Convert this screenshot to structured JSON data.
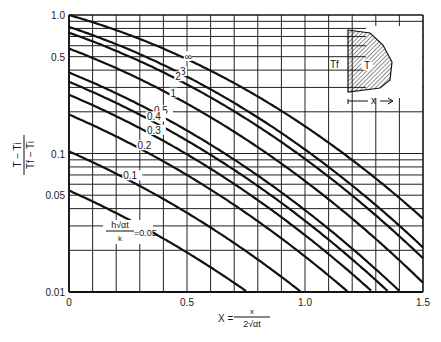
{
  "chart_data": {
    "type": "line",
    "title": "",
    "xlabel": "X = x / (2√(αt))",
    "ylabel": "(T − Ti) / (Tf − Ti)",
    "xscale": "linear",
    "yscale": "log",
    "xlim": [
      0,
      1.5
    ],
    "ylim": [
      0.01,
      1.0
    ],
    "grid": true,
    "x_ticks": [
      {
        "value": 0,
        "label": "0"
      },
      {
        "value": 0.5,
        "label": "0.5"
      },
      {
        "value": 1.0,
        "label": "1.0"
      },
      {
        "value": 1.5,
        "label": "1.5"
      }
    ],
    "y_ticks": [
      {
        "value": 1.0,
        "label": "1.0"
      },
      {
        "value": 0.5,
        "label": "0.5"
      },
      {
        "value": 0.1,
        "label": "0.1"
      },
      {
        "value": 0.05,
        "label": "0.05"
      },
      {
        "value": 0.01,
        "label": "0.01"
      }
    ],
    "legend_title": "h√(αt)/k",
    "x": [
      0,
      0.1,
      0.2,
      0.3,
      0.4,
      0.5,
      0.6,
      0.7,
      0.8,
      0.9,
      1.0,
      1.1,
      1.2,
      1.3,
      1.4,
      1.5
    ],
    "series": [
      {
        "name": "∞",
        "H": 1000,
        "label": "∞",
        "values": [
          1.0,
          0.888,
          0.777,
          0.671,
          0.572,
          0.48,
          0.396,
          0.322,
          0.258,
          0.203,
          0.157,
          0.12,
          0.0897,
          0.066,
          0.0477,
          0.0339
        ]
      },
      {
        "name": "3",
        "H": 3,
        "label": "3",
        "values": [
          0.835,
          0.737,
          0.642,
          0.551,
          0.467,
          0.39,
          0.32,
          0.259,
          0.206,
          0.161,
          0.124,
          0.094,
          0.07,
          0.0512,
          0.0368,
          0.026
        ]
      },
      {
        "name": "2",
        "H": 2,
        "label": "2",
        "values": [
          0.745,
          0.655,
          0.569,
          0.487,
          0.411,
          0.342,
          0.28,
          0.225,
          0.179,
          0.139,
          0.107,
          0.081,
          0.0601,
          0.0438,
          0.0314,
          0.0221
        ]
      },
      {
        "name": "1",
        "H": 1,
        "label": "1",
        "values": [
          0.573,
          0.5,
          0.431,
          0.366,
          0.307,
          0.253,
          0.205,
          0.164,
          0.129,
          0.0995,
          0.0757,
          0.0567,
          0.0418,
          0.0302,
          0.0215,
          0.015
        ]
      },
      {
        "name": "0.5",
        "H": 0.5,
        "label": "0.5",
        "values": [
          0.385,
          0.333,
          0.285,
          0.24,
          0.199,
          0.163,
          0.131,
          0.104,
          0.081,
          0.0621,
          0.0469,
          0.0349,
          0.0255,
          0.0184,
          0.013,
          0.009
        ]
      },
      {
        "name": "0.4",
        "H": 0.4,
        "label": "0.4",
        "values": [
          0.329,
          0.284,
          0.242,
          0.203,
          0.168,
          0.137,
          0.11,
          0.087,
          0.0677,
          0.0518,
          0.039,
          0.029,
          0.0212,
          0.0152,
          0.0108,
          0.0075
        ]
      },
      {
        "name": "0.3",
        "H": 0.3,
        "label": "0.3",
        "values": [
          0.265,
          0.228,
          0.194,
          0.162,
          0.134,
          0.109,
          0.0872,
          0.0688,
          0.0534,
          0.0408,
          0.0307,
          0.0228,
          0.0166,
          0.0119,
          0.0084,
          0.0058
        ]
      },
      {
        "name": "0.2",
        "H": 0.2,
        "label": "0.2",
        "values": [
          0.19,
          0.163,
          0.138,
          0.115,
          0.0947,
          0.0768,
          0.0614,
          0.0483,
          0.0374,
          0.0285,
          0.0214,
          0.0159,
          0.0116,
          0.0083,
          0.0058,
          0.004
        ]
      },
      {
        "name": "0.1",
        "H": 0.1,
        "label": "0.1",
        "values": [
          0.103,
          0.0877,
          0.074,
          0.0615,
          0.0505,
          0.0408,
          0.0325,
          0.0255,
          0.0197,
          0.015,
          0.0112,
          0.0083,
          0.006,
          0.0043,
          0.003,
          0.0021
        ]
      },
      {
        "name": "0.05",
        "H": 0.05,
        "label": "h√(αt)/k = 0.05",
        "values": [
          0.0538,
          0.0458,
          0.0385,
          0.032,
          0.0262,
          0.0211,
          0.0168,
          0.0132,
          0.0102,
          0.0077,
          0.0058,
          0.0043,
          0.0031,
          0.0022,
          0.0016,
          0.0011
        ]
      }
    ],
    "inset": {
      "description": "semi-infinite solid with convection boundary",
      "fluid_label": "Tf",
      "solid_label": "T",
      "axis_label": "x"
    }
  },
  "axis_text": {
    "y_num": "T − Ti",
    "y_den": "Tf − Ti",
    "x_prefix": "X =",
    "x_num": "x",
    "x_den": "2√αt",
    "param_num": "h√αt",
    "param_den": "k",
    "param_eq": "=0.05"
  }
}
